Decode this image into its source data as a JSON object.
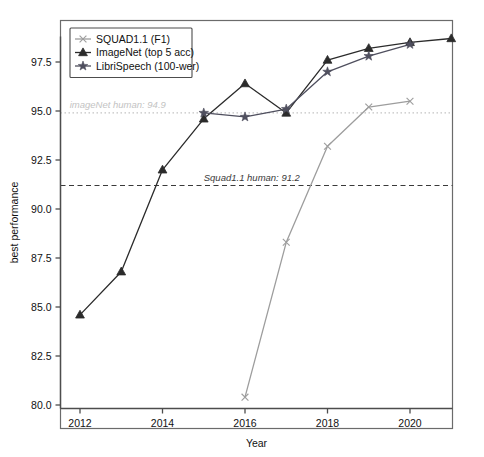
{
  "chart_data": {
    "type": "line",
    "title": "",
    "xlabel": "Year",
    "ylabel": "best performance",
    "xlim": [
      2011.4,
      2021.4
    ],
    "ylim": [
      79.3,
      99.4
    ],
    "xticks": [
      2012,
      2014,
      2016,
      2018,
      2020
    ],
    "xtick_labels": [
      "2012",
      "2014",
      "2016",
      "2018",
      "2020"
    ],
    "yticks": [
      80.0,
      82.5,
      85.0,
      87.5,
      90.0,
      92.5,
      95.0,
      97.5
    ],
    "ytick_labels": [
      "80.0",
      "82.5",
      "85.0",
      "87.5",
      "90.0",
      "92.5",
      "95.0",
      "97.5"
    ],
    "grid": false,
    "legend_position": "upper left",
    "series": [
      {
        "name": "SQUAD1.1 (F1)",
        "color": "#9d9d9d",
        "marker": "x",
        "x": [
          2016,
          2017,
          2018,
          2019,
          2020
        ],
        "values": [
          80.4,
          88.3,
          93.2,
          95.2,
          95.5
        ]
      },
      {
        "name": "ImageNet (top 5 acc)",
        "color": "#2b2b2b",
        "marker": "triangle",
        "x": [
          2012,
          2013,
          2014,
          2015,
          2016,
          2017,
          2018,
          2019,
          2020,
          2021
        ],
        "values": [
          84.6,
          86.8,
          92.0,
          94.6,
          96.4,
          94.9,
          97.6,
          98.2,
          98.5,
          98.7
        ]
      },
      {
        "name": "LibriSpeech (100-wer)",
        "color": "#4f4f5e",
        "marker": "star",
        "x": [
          2015,
          2016,
          2017,
          2018,
          2019,
          2020
        ],
        "values": [
          94.9,
          94.7,
          95.1,
          97.0,
          97.8,
          98.4
        ]
      }
    ],
    "hlines": [
      {
        "name": "imagenet-human-line",
        "label": "imageNet human: 94.9",
        "value": 94.9,
        "color": "#c3c3c3",
        "dash": "1.5,2.5",
        "label_x": 2011.75,
        "label_dy": -5
      },
      {
        "name": "squad-human-line",
        "label": "Squad1.1 human: 91.2",
        "value": 91.2,
        "color": "#3a3a3a",
        "dash": "5,3.5",
        "label_x": 2015.0,
        "label_dy": -4
      }
    ]
  }
}
